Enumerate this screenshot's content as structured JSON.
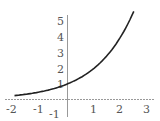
{
  "chart_data": {
    "type": "line",
    "title": "",
    "xlabel": "",
    "ylabel": "",
    "function": "y = 2^x",
    "xlim": [
      -2.1,
      3.1
    ],
    "ylim": [
      -1,
      5.6
    ],
    "grid": false,
    "legend": null,
    "x_ticks": [
      "-2",
      "-1",
      "1",
      "2",
      "3"
    ],
    "y_ticks": [
      "1",
      "2",
      "3",
      "4",
      "5"
    ],
    "y_neg_tick": "-1",
    "series": [
      {
        "name": "curve",
        "color": "#222222",
        "x": [
          -2,
          -1.5,
          -1,
          -0.5,
          0,
          0.5,
          1,
          1.5,
          2,
          2.5
        ],
        "y": [
          0.25,
          0.35,
          0.5,
          0.71,
          1,
          1.41,
          2,
          2.83,
          4,
          5.66
        ]
      }
    ]
  },
  "labels": {
    "xt0": "-2",
    "xt1": "-1",
    "xt2": "1",
    "xt3": "2",
    "xt4": "3",
    "yt0": "1",
    "yt1": "2",
    "yt2": "3",
    "yt3": "4",
    "yt4": "5",
    "yneg": "-1"
  }
}
